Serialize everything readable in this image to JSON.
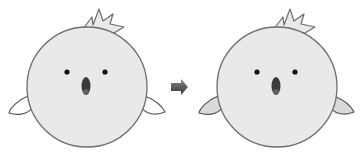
{
  "scene": {
    "description": "Two chick characters with an arrow between them indicating a transformation",
    "colors": {
      "background": "#ffffff",
      "body_fill": "#e9e9e9",
      "outline": "#6e6e6e",
      "eye": "#111111",
      "beak": "#3a3a3a",
      "arrow": "#4a4a4a",
      "wing_before": "#ffffff",
      "wing_after": "#d9d9d9"
    },
    "characters": [
      {
        "label": "before",
        "wing_style": "white-outline"
      },
      {
        "label": "after",
        "wing_style": "gray-filled"
      }
    ],
    "arrow": {
      "direction": "right"
    }
  }
}
